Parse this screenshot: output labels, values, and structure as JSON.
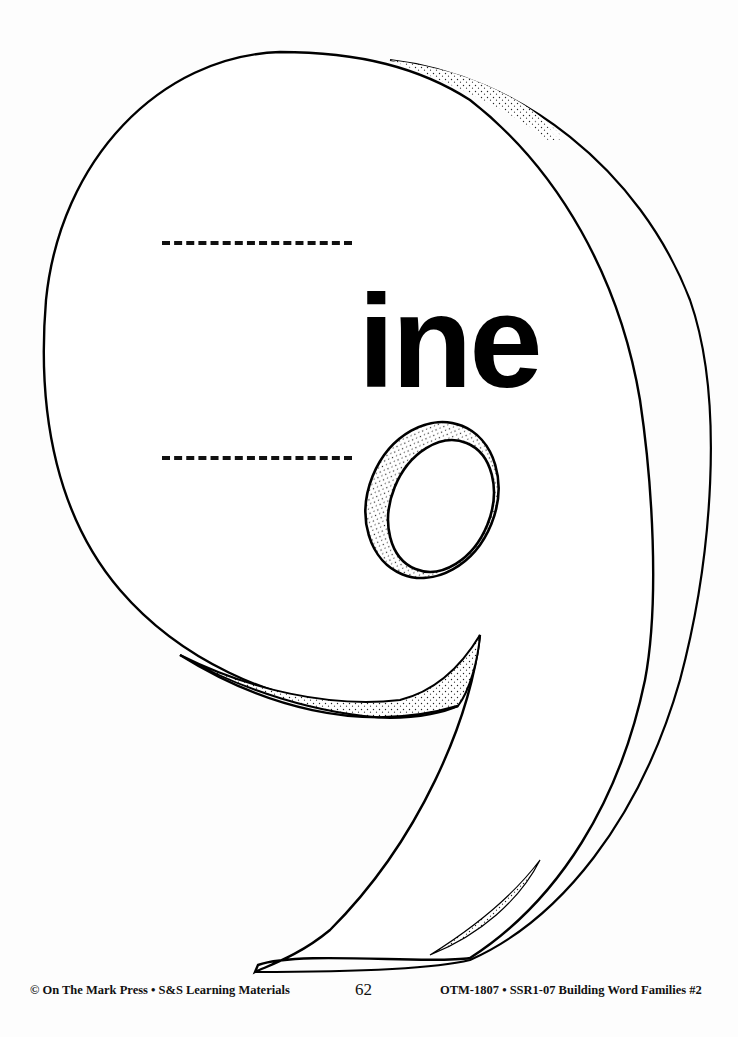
{
  "worksheet": {
    "digit_shape": "9",
    "word_ending": "ine",
    "answer_lines": [
      {
        "id": "top-line",
        "value": ""
      },
      {
        "id": "bottom-line",
        "value": ""
      }
    ]
  },
  "footer": {
    "copyright": "© On The Mark Press • S&S Learning Materials",
    "page_number": "62",
    "product_code": "OTM-1807 • SSR1-07 Building Word Families #2"
  },
  "colors": {
    "ink": "#000000",
    "paper": "#fdfdfd"
  }
}
